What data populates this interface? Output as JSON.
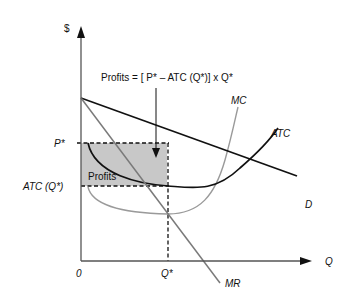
{
  "diagram": {
    "type": "economics-monopoly-profit",
    "axes": {
      "y_label": "$",
      "x_label": "Q",
      "origin_label": "0"
    },
    "price_labels": {
      "p_star": "P*",
      "atc_q_star": "ATC (Q*)"
    },
    "quantity_labels": {
      "q_star": "Q*"
    },
    "curve_labels": {
      "mc": "MC",
      "atc": "ATC",
      "demand": "D",
      "mr": "MR"
    },
    "annotation": "Profits = [ P* – ATC (Q*)] x Q*",
    "profit_area_label": "Profits",
    "colors": {
      "profit_fill": "#c8c8c8",
      "mc_curve": "#9a9a9a",
      "mr_curve": "#7a7a7a",
      "black_curves": "#111111"
    }
  }
}
